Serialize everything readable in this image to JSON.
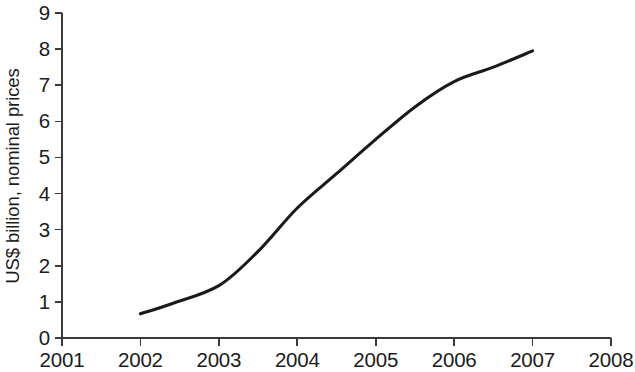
{
  "chart_data": {
    "type": "line",
    "title": "",
    "xlabel": "",
    "ylabel": "US$ billion, nominal prices",
    "xlim": [
      2001,
      2008
    ],
    "ylim": [
      0,
      9
    ],
    "grid": false,
    "legend": null,
    "x_ticks": [
      "2001",
      "2002",
      "2003",
      "2004",
      "2005",
      "2006",
      "2007",
      "2008"
    ],
    "y_ticks": [
      "0",
      "1",
      "2",
      "3",
      "4",
      "5",
      "6",
      "7",
      "8",
      "9"
    ],
    "series": [
      {
        "name": "US$ billion, nominal prices",
        "color": "#1a1a1a",
        "line_width": 3.1,
        "x": [
          2002,
          2002.4,
          2003,
          2003.5,
          2004,
          2004.5,
          2005,
          2005.5,
          2006,
          2006.5,
          2007
        ],
        "values": [
          0.67,
          0.95,
          1.45,
          2.4,
          3.6,
          4.55,
          5.5,
          6.4,
          7.1,
          7.5,
          7.95
        ]
      }
    ]
  }
}
